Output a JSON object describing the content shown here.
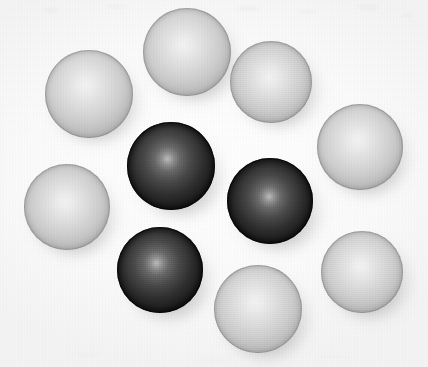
{
  "image": {
    "title": "Array of glossy spheres",
    "width": 428,
    "height": 367,
    "background_color": "#fdfdfd",
    "description": "Ten shaded spheres arranged in a loose ring on a plain white background; seven are light grey and three are dark grey/black, each with a central specular highlight and a soft drop shadow to the lower right.",
    "light_direction": "front, slightly above and left of center",
    "sphere_count": 10,
    "light_sphere_count": 7,
    "dark_sphere_count": 3
  },
  "palette": {
    "background": "#fdfdfd",
    "light_highlight": "#f4f4f4",
    "light_mid": "#cfcfcf",
    "light_edge": "#a2a2a2",
    "light_rim": "#8e8e8e",
    "dark_highlight": "#bdbdbd",
    "dark_mid": "#4a4a4a",
    "dark_edge": "#141414",
    "dark_rim": "#0a0a0a",
    "shadow": "rgba(60,60,60,0.34)"
  },
  "spheres": [
    {
      "id": "sphere-light-top-left",
      "label": "Light sphere, upper left",
      "tone": "light",
      "cx": 89,
      "cy": 94,
      "r": 44,
      "highlight_x": 46,
      "highlight_y": 40,
      "shadow_dx": 7,
      "shadow_dy": 10
    },
    {
      "id": "sphere-light-top-center",
      "label": "Light sphere, top center",
      "tone": "light",
      "cx": 187,
      "cy": 52,
      "r": 44,
      "highlight_x": 46,
      "highlight_y": 42,
      "shadow_dx": 8,
      "shadow_dy": 11
    },
    {
      "id": "sphere-light-top-right",
      "label": "Light sphere, upper right",
      "tone": "light",
      "cx": 271,
      "cy": 82,
      "r": 41,
      "highlight_x": 48,
      "highlight_y": 44,
      "shadow_dx": 8,
      "shadow_dy": 10
    },
    {
      "id": "sphere-light-right-upper",
      "label": "Light sphere, right side upper",
      "tone": "light",
      "cx": 360,
      "cy": 147,
      "r": 43,
      "highlight_x": 47,
      "highlight_y": 42,
      "shadow_dx": 7,
      "shadow_dy": 11
    },
    {
      "id": "sphere-light-left-middle",
      "label": "Light sphere, left middle",
      "tone": "light",
      "cx": 67,
      "cy": 207,
      "r": 43,
      "highlight_x": 48,
      "highlight_y": 44,
      "shadow_dx": 7,
      "shadow_dy": 11
    },
    {
      "id": "sphere-dark-center-left",
      "label": "Dark sphere, center left",
      "tone": "dark",
      "cx": 171,
      "cy": 166,
      "r": 44,
      "highlight_x": 46,
      "highlight_y": 42,
      "shadow_dx": 9,
      "shadow_dy": 12
    },
    {
      "id": "sphere-dark-center-right",
      "label": "Dark sphere, center right",
      "tone": "dark",
      "cx": 270,
      "cy": 201,
      "r": 43,
      "highlight_x": 49,
      "highlight_y": 45,
      "shadow_dx": 9,
      "shadow_dy": 12
    },
    {
      "id": "sphere-dark-bottom-left",
      "label": "Dark sphere, lower left",
      "tone": "dark",
      "cx": 160,
      "cy": 270,
      "r": 43,
      "highlight_x": 46,
      "highlight_y": 42,
      "shadow_dx": 9,
      "shadow_dy": 12
    },
    {
      "id": "sphere-light-bottom-center",
      "label": "Light sphere, bottom center",
      "tone": "light",
      "cx": 258,
      "cy": 309,
      "r": 44,
      "highlight_x": 47,
      "highlight_y": 42,
      "shadow_dx": 8,
      "shadow_dy": 11
    },
    {
      "id": "sphere-light-bottom-right",
      "label": "Light sphere, lower right",
      "tone": "light",
      "cx": 362,
      "cy": 272,
      "r": 41,
      "highlight_x": 48,
      "highlight_y": 43,
      "shadow_dx": 8,
      "shadow_dy": 11
    }
  ]
}
